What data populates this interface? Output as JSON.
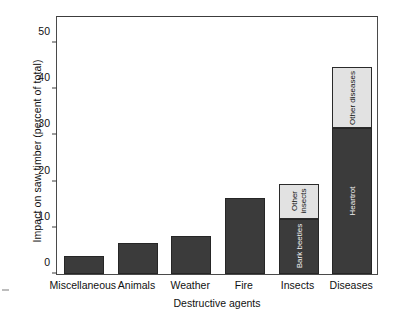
{
  "chart_data": {
    "type": "bar",
    "title": "",
    "subtitle": "",
    "xlabel": "Destructive agents",
    "ylabel": "Impact on saw timber (percent of total)",
    "categories": [
      "Miscellaneous",
      "Animals",
      "Weather",
      "Fire",
      "Insects",
      "Diseases"
    ],
    "ylim": [
      0,
      56
    ],
    "yticks": [
      0,
      10,
      20,
      30,
      40,
      50
    ],
    "ytick_labels": [
      "0",
      "10",
      "20",
      "30",
      "40",
      "50"
    ],
    "grid": false,
    "legend": "none",
    "stacked": true,
    "totals": [
      3.8,
      6.8,
      8.3,
      16.4,
      19.4,
      44.7
    ],
    "bars": [
      {
        "category": "Miscellaneous",
        "total": 3.8,
        "segments": [
          {
            "label": "",
            "value": 3.8,
            "color": "#3b3b3b",
            "shade": "dark"
          }
        ]
      },
      {
        "category": "Animals",
        "total": 6.8,
        "segments": [
          {
            "label": "",
            "value": 6.8,
            "color": "#3b3b3b",
            "shade": "dark"
          }
        ]
      },
      {
        "category": "Weather",
        "total": 8.3,
        "segments": [
          {
            "label": "",
            "value": 8.3,
            "color": "#3b3b3b",
            "shade": "dark"
          }
        ]
      },
      {
        "category": "Fire",
        "total": 16.4,
        "segments": [
          {
            "label": "",
            "value": 16.4,
            "color": "#3b3b3b",
            "shade": "dark"
          }
        ]
      },
      {
        "category": "Insects",
        "total": 19.4,
        "segments": [
          {
            "label": "Bark beetles",
            "value": 12.0,
            "color": "#3b3b3b",
            "shade": "dark"
          },
          {
            "label": "Other insects",
            "value": 7.4,
            "color": "#e2e2e2",
            "shade": "light"
          }
        ]
      },
      {
        "category": "Diseases",
        "total": 44.7,
        "segments": [
          {
            "label": "Heartrot",
            "value": 31.6,
            "color": "#3b3b3b",
            "shade": "dark"
          },
          {
            "label": "Other diseases",
            "value": 13.1,
            "color": "#e2e2e2",
            "shade": "light"
          }
        ]
      }
    ],
    "colors": {
      "dark_segment": "#3b3b3b",
      "light_segment": "#e2e2e2",
      "axis": "#3c3c3c",
      "text": "#111111",
      "background": "#ffffff"
    }
  }
}
